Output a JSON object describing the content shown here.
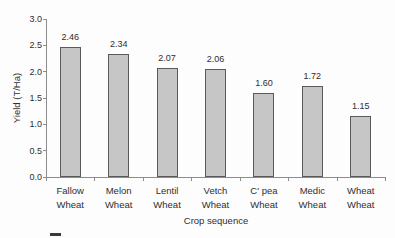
{
  "colors": {
    "background": "#fdfdfd",
    "bar_fill": "#c6c6c6",
    "bar_border": "#5a5a5a",
    "axis": "#8c8c8c",
    "text": "#2f2f2f"
  },
  "chart_data": {
    "type": "bar",
    "title": "",
    "xlabel": "Crop sequence",
    "ylabel": "Yield (T/Ha)",
    "ylim": [
      0.0,
      3.0
    ],
    "ytick_step": 0.5,
    "ytick_labels": [
      "0.0",
      "0.5",
      "1.0",
      "1.5",
      "2.0",
      "2.5",
      "3.0"
    ],
    "categories": [
      [
        "Fallow",
        "Wheat"
      ],
      [
        "Melon",
        "Wheat"
      ],
      [
        "Lentil",
        "Wheat"
      ],
      [
        "Vetch",
        "Wheat"
      ],
      [
        "C' pea",
        "Wheat"
      ],
      [
        "Medic",
        "Wheat"
      ],
      [
        "Wheat",
        "Wheat"
      ]
    ],
    "values": [
      2.46,
      2.34,
      2.07,
      2.06,
      1.6,
      1.72,
      1.15
    ],
    "data_labels": [
      "2.46",
      "2.34",
      "2.07",
      "2.06",
      "1.60",
      "1.72",
      "1.15"
    ],
    "grid": false,
    "legend_position": "bottom-left-cutoff"
  }
}
